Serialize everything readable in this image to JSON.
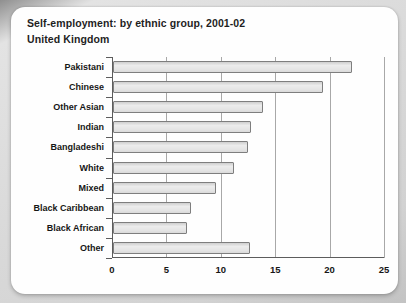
{
  "page": {
    "title": "Self-employment: by ethnic group, 2001-02",
    "subtitle": "United Kingdom"
  },
  "chart_data": {
    "type": "bar",
    "orientation": "horizontal",
    "title": "Self-employment: by ethnic group, 2001-02",
    "subtitle": "United Kingdom",
    "categories": [
      "Pakistani",
      "Chinese",
      "Other Asian",
      "Indian",
      "Bangladeshi",
      "White",
      "Mixed",
      "Black Caribbean",
      "Black African",
      "Other"
    ],
    "values": [
      22,
      19.3,
      13.8,
      12.7,
      12.4,
      11.1,
      9.5,
      7.2,
      6.8,
      12.6
    ],
    "xlabel": "",
    "ylabel": "",
    "xlim": [
      0,
      25
    ],
    "xticks": [
      0,
      5,
      10,
      15,
      20,
      25
    ],
    "grid": true,
    "legend": false,
    "colors": {
      "bar_fill": "#e4e4e4",
      "bar_border": "#7e7e7e",
      "gridline": "#a8a8a8",
      "axis": "#5c5c5c",
      "text": "#1f1f1f",
      "card_background": "#fefefe",
      "page_background": "#d2d2d2"
    }
  }
}
